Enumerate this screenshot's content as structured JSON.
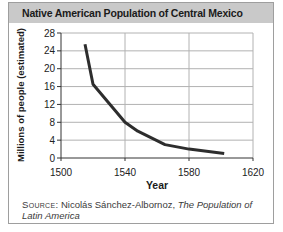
{
  "card": {
    "title": "Native American Population of Central Mexico",
    "source": {
      "label": "Source:",
      "author": " Nicolás Sánchez-Albornoz, ",
      "work": "The Population of Latin America"
    }
  },
  "chart_data": {
    "type": "line",
    "title": "Native American Population of Central Mexico",
    "xlabel": "Year",
    "ylabel": "Millions of people (estimated)",
    "xlim": [
      1500,
      1620
    ],
    "ylim": [
      0,
      28
    ],
    "x_ticks": [
      1500,
      1540,
      1580,
      1620
    ],
    "y_ticks": [
      0,
      4,
      8,
      12,
      16,
      20,
      24,
      28
    ],
    "grid": true,
    "legend": false,
    "series": [
      {
        "name": "Native American population (millions, estimated)",
        "points": [
          [
            1515,
            25.5
          ],
          [
            1520,
            16.5
          ],
          [
            1540,
            8
          ],
          [
            1548,
            6
          ],
          [
            1565,
            3
          ],
          [
            1580,
            2
          ],
          [
            1602,
            1
          ]
        ]
      }
    ],
    "colors": {
      "line": "#2d2d2d",
      "grid": "#b2b2b2",
      "axis": "#333333",
      "header_bg": "#c9c9c9"
    }
  }
}
